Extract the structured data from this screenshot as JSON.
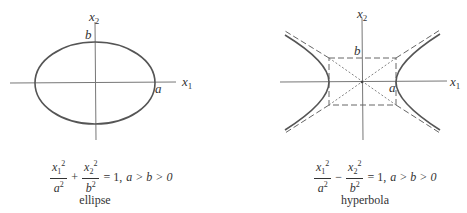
{
  "figures": [
    {
      "id": "ellipse",
      "caption": "ellipse",
      "equation": {
        "term1_num": "x",
        "term1_num_sub": "1",
        "term1_num_sup": "2",
        "term1_den": "a",
        "term1_den_sup": "2",
        "operator": "+",
        "term2_num": "x",
        "term2_num_sub": "2",
        "term2_num_sup": "2",
        "term2_den": "b",
        "term2_den_sup": "2",
        "rhs": "= 1,",
        "condition": "a > b > 0"
      },
      "labels": {
        "x_axis": "x",
        "x_axis_sub": "1",
        "y_axis": "x",
        "y_axis_sub": "2",
        "a": "a",
        "b": "b"
      }
    },
    {
      "id": "hyperbola",
      "caption": "hyperbola",
      "equation": {
        "term1_num": "x",
        "term1_num_sub": "1",
        "term1_num_sup": "2",
        "term1_den": "a",
        "term1_den_sup": "2",
        "operator": "−",
        "term2_num": "x",
        "term2_num_sub": "2",
        "term2_num_sup": "2",
        "term2_den": "b",
        "term2_den_sup": "2",
        "rhs": "= 1,",
        "condition": "a > b > 0"
      },
      "labels": {
        "x_axis": "x",
        "x_axis_sub": "1",
        "y_axis": "x",
        "y_axis_sub": "2",
        "a": "a",
        "b": "b"
      }
    }
  ],
  "colors": {
    "curve": "#555555",
    "axis": "#666666",
    "text": "#333333"
  }
}
